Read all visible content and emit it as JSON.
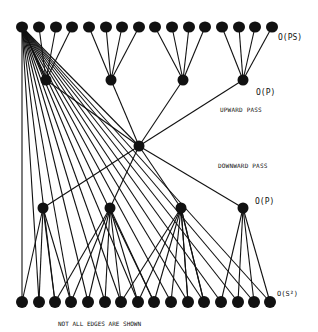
{
  "figure": {
    "labels": {
      "top_level": "O(PS)",
      "upper_p_level": "O(P)",
      "upward_pass": "UPWARD PASS",
      "downward_pass": "DOWNWARD PASS",
      "lower_p_level": "O(P)",
      "bottom_level": "O(S²)",
      "note": "NOT ALL EDGES ARE SHOWN"
    },
    "colors": {
      "ink": "#111111",
      "background": "#ffffff"
    },
    "nodes": {
      "top_y": 27,
      "top_x": [
        22,
        39,
        56,
        72,
        89,
        106,
        122,
        139,
        155,
        172,
        189,
        205,
        222,
        239,
        255,
        272
      ],
      "upper_p_y": 80,
      "upper_p_x": [
        46,
        111,
        183,
        243
      ],
      "center": [
        139,
        146
      ],
      "lower_p_y": 208,
      "lower_p_x": [
        43,
        110,
        181,
        243
      ],
      "bottom_y": 302,
      "bottom_x": [
        22,
        39,
        55,
        71,
        88,
        105,
        121,
        138,
        154,
        171,
        188,
        204,
        221,
        238,
        254,
        270
      ]
    }
  }
}
